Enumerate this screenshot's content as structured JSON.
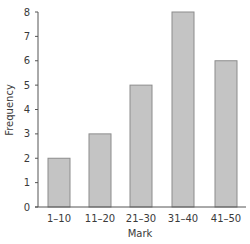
{
  "chart_data": {
    "type": "bar",
    "title": "",
    "xlabel": "Mark",
    "ylabel": "Frequency",
    "categories": [
      "1–10",
      "11–20",
      "21–30",
      "31–40",
      "41–50"
    ],
    "values": [
      2,
      3,
      5,
      8,
      6
    ],
    "ylim": [
      0,
      8
    ],
    "yticks": [
      0,
      1,
      2,
      3,
      4,
      5,
      6,
      7,
      8
    ],
    "grid": false,
    "legend": null,
    "colors": {
      "bar_fill": "#c4c4c4",
      "bar_stroke": "#8c8c8c",
      "axis": "#555555"
    }
  }
}
